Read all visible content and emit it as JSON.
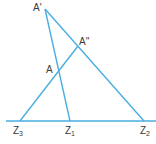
{
  "diagram": {
    "line_color": "#4aaee0",
    "label_color": "#3a3a3a",
    "points": {
      "A_prime": {
        "label": "A'",
        "x": 45,
        "y": 9
      },
      "A_double_prime": {
        "label": "A''",
        "x": 78,
        "y": 46
      },
      "A": {
        "label": "A",
        "x": 59,
        "y": 70
      },
      "Z3": {
        "label": "Z",
        "sub": "3",
        "x": 20,
        "y": 121
      },
      "Z1": {
        "label": "Z",
        "sub": "1",
        "x": 70,
        "y": 121
      },
      "Z2": {
        "label": "Z",
        "sub": "2",
        "x": 144,
        "y": 121
      }
    },
    "lines": [
      {
        "from": "A_prime",
        "to": "Z1"
      },
      {
        "from": "A_prime",
        "to": "Z2"
      },
      {
        "from": "Z3",
        "to": "A_double_prime"
      },
      {
        "from": "baseline_start",
        "to": "baseline_end"
      }
    ]
  }
}
